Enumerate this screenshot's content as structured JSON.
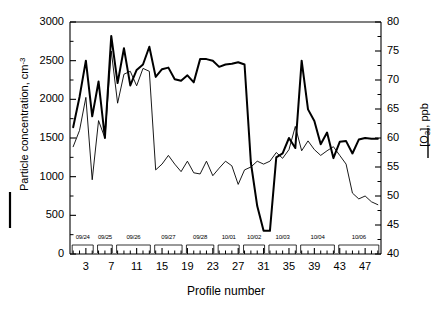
{
  "chart_data": {
    "type": "line",
    "title": "",
    "xlabel": "Profile number",
    "ylabel_left": "Particle concentration, cm",
    "ylabel_left_sup": "-3",
    "ylabel_right_prefix": "[O",
    "ylabel_right_sub": "3",
    "ylabel_right_suffix": "], ppb",
    "grid": false,
    "legend_position": "axis-labels",
    "x": [
      1,
      2,
      3,
      4,
      5,
      6,
      7,
      8,
      9,
      10,
      11,
      12,
      13,
      14,
      15,
      16,
      17,
      18,
      19,
      20,
      21,
      22,
      23,
      24,
      25,
      26,
      27,
      28,
      29,
      30,
      31,
      32,
      33,
      34,
      35,
      36,
      37,
      38,
      39,
      40,
      41,
      42,
      43,
      44,
      45,
      46,
      47,
      48,
      49
    ],
    "xlim": [
      0.5,
      49.5
    ],
    "xticks": [
      3,
      7,
      11,
      15,
      19,
      23,
      27,
      31,
      35,
      39,
      43,
      47
    ],
    "xticklabels": [
      "3",
      "7",
      "11",
      "15",
      "19",
      "23",
      "27",
      "31",
      "35",
      "39",
      "43",
      "47"
    ],
    "xminor_step": 1,
    "yticks_left": [
      0,
      500,
      1000,
      1500,
      2000,
      2500,
      3000
    ],
    "yticklabels_left": [
      "0",
      "500",
      "1000",
      "1500",
      "2000",
      "2500",
      "3000"
    ],
    "ylim_left": [
      0,
      3000
    ],
    "yminor_left_step": 250,
    "yticks_right": [
      40,
      45,
      50,
      55,
      60,
      65,
      70,
      75,
      80
    ],
    "yticklabels_right": [
      "40",
      "45",
      "50",
      "55",
      "60",
      "65",
      "70",
      "75",
      "80"
    ],
    "ylim_right": [
      40,
      80
    ],
    "yminor_right_step": 2.5,
    "series": [
      {
        "name": "Particle concentration, cm-3",
        "axis": "left",
        "style": "thick",
        "color": "#000000",
        "linewidth": 2.0,
        "values": [
          1640,
          2030,
          2500,
          1780,
          2230,
          1500,
          2820,
          2210,
          2660,
          2180,
          2380,
          2450,
          2680,
          2290,
          2390,
          2410,
          2260,
          2240,
          2310,
          2220,
          2520,
          2520,
          2500,
          2420,
          2450,
          2460,
          2480,
          2450,
          1180,
          620,
          300,
          300,
          1250,
          1300,
          1500,
          1370,
          2500,
          1870,
          1720,
          1420,
          1570,
          1240,
          1450,
          1460,
          1300,
          1480,
          1500,
          1490,
          1490
        ],
        "left_values_ppb_equivalent": null
      },
      {
        "name": "[O3], ppb",
        "axis": "right",
        "style": "thin",
        "color": "#000000",
        "linewidth": 0.9,
        "values": [
          58.5,
          61.3,
          67.0,
          52.8,
          63.0,
          60.0,
          75.0,
          66.0,
          71.0,
          71.5,
          69.0,
          72.0,
          71.5,
          54.5,
          55.5,
          57.0,
          55.5,
          54.2,
          56.0,
          54.0,
          53.8,
          56.0,
          53.5,
          54.8,
          56.0,
          55.2,
          52.0,
          54.5,
          55.0,
          56.0,
          55.5,
          56.0,
          57.5,
          56.5,
          58.0,
          62.0,
          57.8,
          59.5,
          58.0,
          57.0,
          57.8,
          58.5,
          57.0,
          55.5,
          50.5,
          49.5,
          50.0,
          49.0,
          48.5
        ]
      }
    ],
    "date_groups": [
      {
        "label": "09/24",
        "start": 1,
        "end": 4
      },
      {
        "label": "09/25",
        "start": 5,
        "end": 7
      },
      {
        "label": "09/26",
        "start": 8,
        "end": 13
      },
      {
        "label": "09/27",
        "start": 14,
        "end": 18
      },
      {
        "label": "09/28",
        "start": 19,
        "end": 23
      },
      {
        "label": "10/01",
        "start": 24,
        "end": 27
      },
      {
        "label": "10/02",
        "start": 28,
        "end": 31
      },
      {
        "label": "10/03",
        "start": 32,
        "end": 36
      },
      {
        "label": "10/04",
        "start": 37,
        "end": 42
      },
      {
        "label": "10/06",
        "start": 43,
        "end": 49
      }
    ]
  },
  "legend": {
    "left_marker": "thick-line-marker",
    "right_marker": "thin-line-marker"
  }
}
